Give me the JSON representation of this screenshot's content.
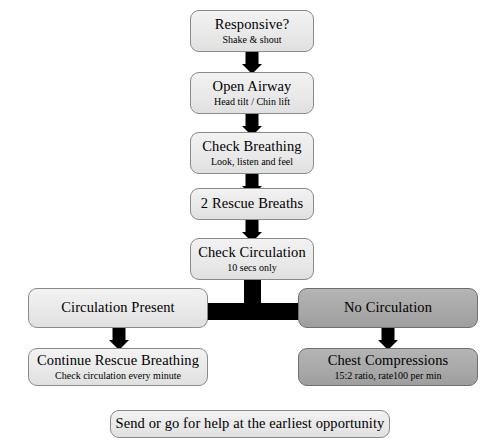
{
  "diagram": {
    "background_color": "#ffffff",
    "colors": {
      "node_light_fill": "#e9e9e9",
      "node_dark_fill": "#a9a9a9",
      "node_border": "#8a8a8a",
      "connector": "#000000",
      "text": "#000000"
    },
    "nodes": [
      {
        "id": "responsive",
        "title": "Responsive?",
        "subtitle": "Shake & shout",
        "style": "light"
      },
      {
        "id": "open-airway",
        "title": "Open Airway",
        "subtitle": "Head tilt / Chin lift",
        "style": "light"
      },
      {
        "id": "check-breathing",
        "title": "Check Breathing",
        "subtitle": "Look, listen and feel",
        "style": "light"
      },
      {
        "id": "rescue-breaths",
        "title": "2 Rescue Breaths",
        "subtitle": "",
        "style": "light"
      },
      {
        "id": "check-circulation",
        "title": "Check Circulation",
        "subtitle": "10 secs only",
        "style": "light"
      },
      {
        "id": "circulation-present",
        "title": "Circulation Present",
        "subtitle": "",
        "style": "light"
      },
      {
        "id": "no-circulation",
        "title": "No Circulation",
        "subtitle": "",
        "style": "dark"
      },
      {
        "id": "continue-rescue-breathing",
        "title": "Continue Rescue Breathing",
        "subtitle": "Check circulation every minute",
        "style": "light"
      },
      {
        "id": "chest-compressions",
        "title": "Chest Compressions",
        "subtitle": "15:2 ratio, rate100 per min",
        "style": "dark"
      },
      {
        "id": "send-for-help",
        "title": "Send or go for help at the earliest opportunity",
        "subtitle": "",
        "style": "light"
      }
    ],
    "connectors": [
      {
        "id": "responsive-to-open-airway",
        "kind": "down-arrow"
      },
      {
        "id": "open-airway-to-check-breathing",
        "kind": "down-arrow"
      },
      {
        "id": "check-breathing-to-rescue-breaths",
        "kind": "down-arrow"
      },
      {
        "id": "rescue-breaths-to-check-circulation",
        "kind": "down-arrow"
      },
      {
        "id": "check-circulation-to-split",
        "kind": "down-stem"
      },
      {
        "id": "split-tee-bar",
        "kind": "horizontal-bar"
      },
      {
        "id": "circulation-present-to-continue-rescue-breathing",
        "kind": "down-arrow"
      },
      {
        "id": "no-circulation-to-chest-compressions",
        "kind": "down-arrow"
      }
    ]
  }
}
